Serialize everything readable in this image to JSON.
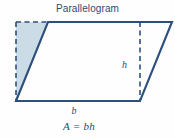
{
  "figure": {
    "title": "Parallelogram",
    "shape_name": "parallelogram",
    "labels": {
      "height": "h",
      "base": "b",
      "formula": "A = bh"
    },
    "colors": {
      "stroke": "#2c4f7c",
      "shaded_fill": "#ccdce7",
      "interior_fill": "#ffffff",
      "text": "#2b4a72",
      "background": "#fefefe"
    },
    "geometry": {
      "parallelogram_points": "48,22 172,22 140,101 16,101",
      "shaded_triangle_points": "16,22 48,22 16,101",
      "dashed_left_edge": {
        "x1": 16,
        "y1": 22,
        "x2": 16,
        "y2": 101
      },
      "dashed_top_edge": {
        "x1": 16,
        "y1": 22,
        "x2": 48,
        "y2": 22
      },
      "dashed_height_line": {
        "x1": 140,
        "y1": 22,
        "x2": 140,
        "y2": 101
      }
    }
  }
}
